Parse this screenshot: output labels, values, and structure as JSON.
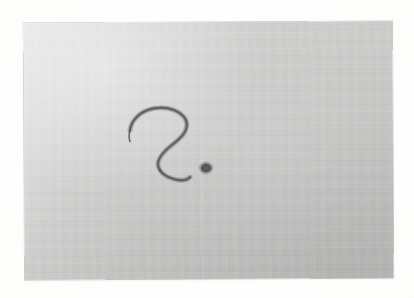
{
  "scene": {
    "type": "photograph",
    "subject": "handwritten question mark on a sheet of paper",
    "width_px": 414,
    "height_px": 298,
    "backdrop_color": "#fdfdfd"
  },
  "paper": {
    "label": "paper sheet",
    "left_px": 24,
    "top_px": 22,
    "width_px": 369,
    "height_px": 257,
    "rotation_deg": -0.28,
    "base_color": "#c6c6c4",
    "highlight_color": "#cfcfcd",
    "shadow_color": "#bcbcba",
    "edge_color": "#aaaaa8",
    "texture": "fine woven / scanned paper grain"
  },
  "drawing": {
    "label": "question mark",
    "glyph": "?",
    "ink_color": "#57575a",
    "ink_opacity": 0.86,
    "stroke_width_px": 2.4,
    "hook": {
      "label": "question mark hook stroke",
      "bounds_px": {
        "x": 130,
        "y": 107,
        "width": 62,
        "height": 50
      }
    },
    "dot": {
      "label": "question mark dot",
      "shape": "ellipse",
      "center_px": {
        "x": 206,
        "y": 168
      },
      "radius_x_px": 5.4,
      "radius_y_px": 4.4,
      "color": "#4f4f52"
    }
  },
  "text": {
    "visible_text": ""
  }
}
